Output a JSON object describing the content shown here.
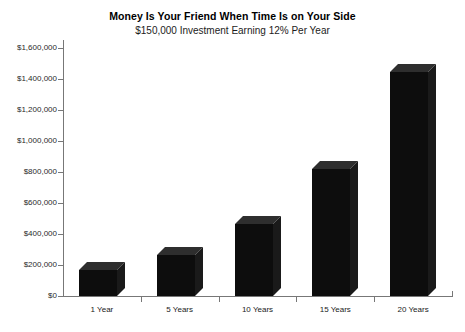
{
  "chart_data": {
    "type": "bar",
    "title": "Money Is Your Friend When Time Is on Your Side",
    "subtitle": "$150,000 Investment Earning 12% Per Year",
    "xlabel": "",
    "ylabel": "",
    "categories": [
      "1 Year",
      "5 Years",
      "10 Years",
      "15 Years",
      "20 Years"
    ],
    "values": [
      168000,
      264000,
      466000,
      821000,
      1447000
    ],
    "ylim": [
      0,
      1600000
    ],
    "ytick_values": [
      0,
      200000,
      400000,
      600000,
      800000,
      1000000,
      1200000,
      1400000,
      1600000
    ],
    "ytick_labels": [
      "$0",
      "$200,000",
      "$400,000",
      "$600,000",
      "$800,000",
      "$1,000,000",
      "$1,200,000",
      "$1,400,000",
      "$1,600,000"
    ],
    "grid": false,
    "legend": null,
    "style": "3d-block-bars",
    "bar_color": "#0d0d0d"
  }
}
